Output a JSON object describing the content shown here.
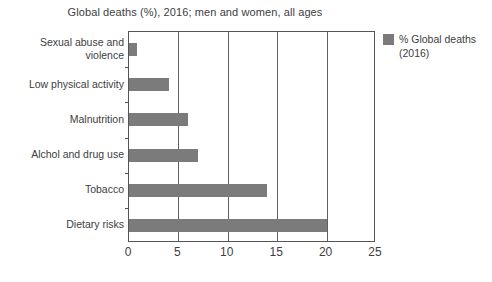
{
  "chart_data": {
    "type": "bar",
    "orientation": "horizontal",
    "title": "Global deaths (%), 2016; men and women, all ages",
    "xlabel": "",
    "ylabel": "",
    "categories": [
      "Sexual abuse and violence",
      "Low physical activity",
      "Malnutrition",
      "Alchol and drug use",
      "Tobacco",
      "Dietary risks"
    ],
    "values": [
      0.8,
      4,
      6,
      7,
      14,
      20
    ],
    "series": [
      {
        "name": "% Global deaths (2016)",
        "values": [
          0.8,
          4,
          6,
          7,
          14,
          20
        ],
        "color": "#7b7b7b"
      }
    ],
    "xlim": [
      0,
      25
    ],
    "xticks": [
      0,
      5,
      10,
      15,
      20,
      25
    ],
    "xtick_labels": [
      "0",
      "5",
      "10",
      "15",
      "20",
      "25"
    ],
    "grid": "vertical",
    "legend_position": "right",
    "legend": [
      "% Global deaths (2016)"
    ]
  },
  "legend": {
    "label_line1": "% Global deaths",
    "label_line2": "(2016)",
    "swatch_color": "#7b7b7b"
  },
  "colors": {
    "bar": "#7b7b7b",
    "axis": "#555555",
    "text": "#404040",
    "background": "#ffffff"
  }
}
